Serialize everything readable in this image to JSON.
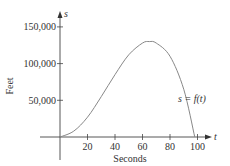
{
  "chart_data": {
    "type": "line",
    "title": "",
    "xlabel": "Seconds",
    "ylabel": "Feet",
    "x_axis_var": "t",
    "y_axis_var": "s",
    "annotation": "s = f(t)",
    "xticks": [
      20,
      40,
      60,
      80,
      100
    ],
    "yticks": [
      50000,
      100000,
      150000
    ],
    "ytick_labels": [
      "50,000",
      "100,000",
      "150,000"
    ],
    "xlim": [
      -10,
      110
    ],
    "ylim": [
      -40000,
      170000
    ],
    "grid": false,
    "legend": "none",
    "series": [
      {
        "name": "s = f(t)",
        "x": [
          0,
          10,
          20,
          30,
          40,
          50,
          60,
          65,
          70,
          80,
          90,
          98
        ],
        "y": [
          0,
          8000,
          27000,
          55000,
          85000,
          112000,
          128000,
          130000,
          128000,
          110000,
          65000,
          0
        ]
      }
    ],
    "color": "#888888"
  }
}
